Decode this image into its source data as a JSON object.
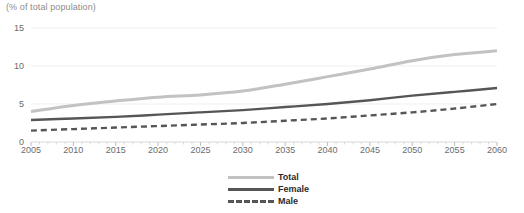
{
  "chart_data": {
    "type": "line",
    "title": "(% of total population)",
    "xlabel": "",
    "ylabel": "",
    "x": [
      2005,
      2010,
      2015,
      2020,
      2025,
      2030,
      2035,
      2040,
      2045,
      2050,
      2055,
      2060
    ],
    "categories": [
      "2005",
      "2010",
      "2015",
      "2020",
      "2025",
      "2030",
      "2035",
      "2040",
      "2045",
      "2050",
      "2055",
      "2060"
    ],
    "xlim": [
      2005,
      2060
    ],
    "ylim": [
      0,
      15
    ],
    "yticks": [
      0,
      5,
      10,
      15
    ],
    "ytick_labels": [
      "0",
      "5",
      "10",
      "15"
    ],
    "grid": true,
    "legend_position": "bottom-center",
    "series": [
      {
        "name": "Total",
        "color": "#c2c2c2",
        "style": "solid",
        "values": [
          4.0,
          4.8,
          5.4,
          5.9,
          6.2,
          6.7,
          7.6,
          8.6,
          9.6,
          10.7,
          11.5,
          12.0
        ]
      },
      {
        "name": "Female",
        "color": "#565656",
        "style": "solid",
        "values": [
          2.9,
          3.1,
          3.3,
          3.6,
          3.9,
          4.2,
          4.6,
          5.0,
          5.5,
          6.1,
          6.6,
          7.1
        ]
      },
      {
        "name": "Male",
        "color": "#565656",
        "style": "dashed",
        "values": [
          1.5,
          1.7,
          1.9,
          2.1,
          2.3,
          2.5,
          2.8,
          3.1,
          3.5,
          3.9,
          4.4,
          5.0
        ]
      }
    ]
  },
  "axis": {
    "title": "(% of total population)"
  },
  "legend": {
    "items": [
      {
        "label": "Total"
      },
      {
        "label": "Female"
      },
      {
        "label": "Male"
      }
    ]
  }
}
